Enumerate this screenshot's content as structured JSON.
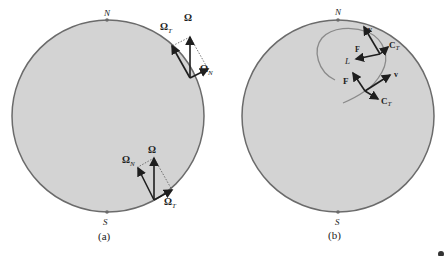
{
  "colors": {
    "disk_fill": "#d3d3d3",
    "disk_stroke": "#6b6b6b",
    "vector": "#1e1e1e",
    "dotted": "#555555",
    "trajectory": "#8a8a8a"
  },
  "panel_a": {
    "caption": "(a)",
    "north_label": "N",
    "south_label": "S",
    "upper_vectors": {
      "omega": "Ω",
      "omega_t_base": "Ω",
      "omega_t_sub": "T",
      "omega_n_base": "Ω",
      "omega_n_sub": "N"
    },
    "lower_vectors": {
      "omega": "Ω",
      "omega_n_base": "Ω",
      "omega_n_sub": "N",
      "omega_t_base": "Ω",
      "omega_t_sub": "T"
    }
  },
  "panel_b": {
    "caption": "(b)",
    "north_label": "N",
    "south_label": "S",
    "upper_vectors": {
      "v": "v",
      "c_t_base": "C",
      "c_t_sub": "T",
      "f": "F",
      "l": "L"
    },
    "lower_vectors": {
      "f": "F",
      "v": "v",
      "c_t_base": "C",
      "c_t_sub": "T"
    }
  }
}
